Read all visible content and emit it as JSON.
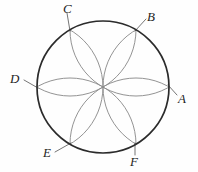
{
  "figure": {
    "background_color": "#fefefe",
    "width": 198,
    "height": 172,
    "main_circle": {
      "name": "main-circle",
      "center_x": 103,
      "center_y": 87,
      "radius": 66,
      "stroke_color": "#2b2b2b",
      "stroke_width": 1.7
    },
    "petal_arcs": {
      "count": 6,
      "radius": 66,
      "stroke_color": "#8d8d8d",
      "stroke_width": 0.95,
      "description": "Six circles of equal radius centred on the six hexagon vertices, clipped to the main circle, forming a six-petal rosette whose petals all meet at the centre."
    },
    "points": [
      {
        "id": "A",
        "label": "A",
        "angle_deg": 0,
        "x": 169,
        "y": 87,
        "label_x": 178,
        "label_y": 92,
        "leader": {
          "x1": 168,
          "y1": 85,
          "x2": 177,
          "y2": 95
        }
      },
      {
        "id": "B",
        "label": "B",
        "angle_deg": 60,
        "x": 136,
        "y": 30,
        "label_x": 147,
        "label_y": 10,
        "leader": {
          "x1": 135,
          "y1": 31,
          "x2": 146,
          "y2": 19
        }
      },
      {
        "id": "C",
        "label": "C",
        "angle_deg": 120,
        "x": 70,
        "y": 30,
        "label_x": 63,
        "label_y": 2,
        "leader": {
          "x1": 70,
          "y1": 31,
          "x2": 67,
          "y2": 13
        }
      },
      {
        "id": "D",
        "label": "D",
        "angle_deg": 180,
        "x": 37,
        "y": 87,
        "label_x": 10,
        "label_y": 72,
        "leader": {
          "x1": 38,
          "y1": 88,
          "x2": 24,
          "y2": 80
        }
      },
      {
        "id": "E",
        "label": "E",
        "angle_deg": 240,
        "x": 70,
        "y": 144,
        "label_x": 43,
        "label_y": 146,
        "leader": {
          "x1": 71,
          "y1": 143,
          "x2": 55,
          "y2": 152
        }
      },
      {
        "id": "F",
        "label": "F",
        "angle_deg": 300,
        "x": 136,
        "y": 144,
        "label_x": 130,
        "label_y": 155,
        "leader": {
          "x1": 135,
          "y1": 143,
          "x2": 135,
          "y2": 155
        }
      }
    ],
    "labels_note": "Vertices A through F are labelled in italic serif with thin leader lines drawn from each label to its point on the circle."
  }
}
